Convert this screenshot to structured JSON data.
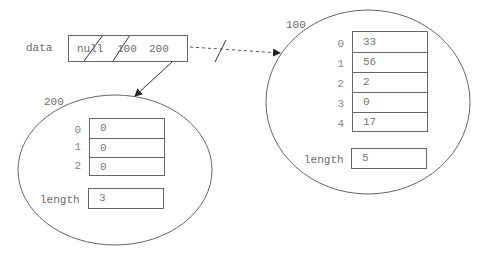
{
  "variable": {
    "name": "data",
    "slots": [
      "null",
      "100",
      "200"
    ],
    "crossed_out": [
      0,
      1
    ]
  },
  "objects": [
    {
      "address": "100",
      "indices": [
        "0",
        "1",
        "2",
        "3",
        "4"
      ],
      "values": [
        "33",
        "56",
        "2",
        "0",
        "17"
      ],
      "length_label": "length",
      "length_value": "5"
    },
    {
      "address": "200",
      "indices": [
        "0",
        "1",
        "2"
      ],
      "values": [
        "0",
        "0",
        "0"
      ],
      "length_label": "length",
      "length_value": "3"
    }
  ],
  "colors": {
    "line": "#666666",
    "text": "#6a6a6a"
  }
}
